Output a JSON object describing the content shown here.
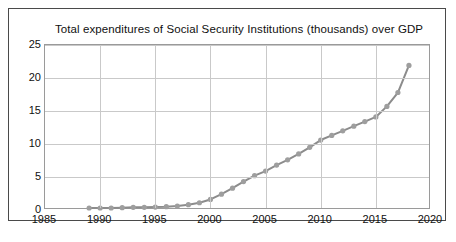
{
  "chart_data": {
    "type": "line",
    "title": "Total expenditures of Social Security Institutions (thousands)  over GDP",
    "xlabel": "",
    "ylabel": "",
    "xlim": [
      1985,
      2020
    ],
    "ylim": [
      0,
      25
    ],
    "xticks": [
      1985,
      1990,
      1995,
      2000,
      2005,
      2010,
      2015,
      2020
    ],
    "yticks": [
      0,
      5,
      10,
      15,
      20,
      25
    ],
    "grid": true,
    "legend": false,
    "marker": "circle",
    "line_color": "#8c8c8c",
    "marker_color": "#9e9e9e",
    "series": [
      {
        "name": "Total expenditures of Social Security Institutions over GDP",
        "x": [
          1989,
          1990,
          1991,
          1992,
          1993,
          1994,
          1995,
          1996,
          1997,
          1998,
          1999,
          2000,
          2001,
          2002,
          2003,
          2004,
          2005,
          2006,
          2007,
          2008,
          2009,
          2010,
          2011,
          2012,
          2013,
          2014,
          2015,
          2016,
          2017,
          2018
        ],
        "values": [
          0.3,
          0.3,
          0.3,
          0.35,
          0.4,
          0.4,
          0.45,
          0.5,
          0.6,
          0.8,
          1.1,
          1.6,
          2.4,
          3.3,
          4.3,
          5.2,
          5.9,
          6.8,
          7.6,
          8.5,
          9.5,
          10.6,
          11.3,
          12.0,
          12.7,
          13.4,
          14.1,
          15.7,
          17.8,
          21.9
        ]
      }
    ]
  },
  "axes": {
    "y_tick_labels": [
      "25",
      "20",
      "15",
      "10",
      "5",
      "0"
    ],
    "x_tick_labels": [
      "1985",
      "1990",
      "1995",
      "2000",
      "2005",
      "2010",
      "2015",
      "2020"
    ]
  }
}
